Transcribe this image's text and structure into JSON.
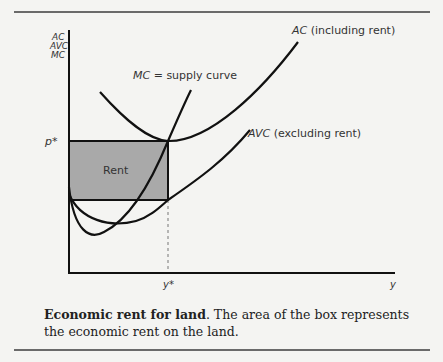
{
  "figure": {
    "y_axis_label_lines": [
      "AC",
      "AVC",
      "MC"
    ],
    "x_axis_label": "y",
    "p_star_label": "p*",
    "y_star_label": "y*",
    "box_label": "Rent",
    "curves": {
      "ac": {
        "name": "AC",
        "note": "(including rent)"
      },
      "avc": {
        "name": "AVC",
        "note": "(excluding rent)"
      },
      "mc": {
        "name": "MC",
        "note": "= supply curve"
      }
    },
    "colors": {
      "box_fill": "#a9a9a9",
      "line": "#111111",
      "background": "#f4f4f2"
    }
  },
  "caption": {
    "bold": "Economic rent for land",
    "text": ". The area of the box represents the economic rent on the land."
  }
}
